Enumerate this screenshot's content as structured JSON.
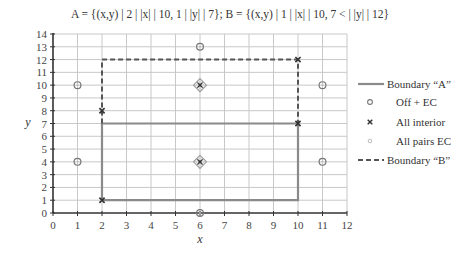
{
  "title": "A = {(x,y) | 2 | |x| | 10, 1 | |y| | 7};  B = {(x,y) | 1 | |x| | 10, 7 < | |y| | 12}",
  "chart_data": {
    "type": "scatter",
    "title": "A = {(x,y) | 2 | |x| | 10, 1 | |y| | 7};  B = {(x,y) | 1 | |x| | 10, 7 < | |y| | 12}",
    "xlabel": "x",
    "ylabel": "y",
    "xlim": [
      0,
      12
    ],
    "ylim": [
      0,
      14
    ],
    "xticks": [
      0,
      1,
      2,
      3,
      4,
      5,
      6,
      7,
      8,
      9,
      10,
      11,
      12
    ],
    "yticks": [
      0,
      1,
      2,
      3,
      4,
      5,
      6,
      7,
      8,
      9,
      10,
      11,
      12,
      13,
      14
    ],
    "grid": true,
    "legend_position": "right",
    "series": [
      {
        "name": "Boundary “A”",
        "kind": "line",
        "style": "solid",
        "color": "#8a8a8a",
        "points": [
          [
            2,
            1
          ],
          [
            10,
            1
          ],
          [
            10,
            7
          ],
          [
            2,
            7
          ],
          [
            2,
            1
          ]
        ]
      },
      {
        "name": "Off + EC",
        "kind": "marker",
        "marker": "circle",
        "color": "#777777",
        "points": [
          [
            1,
            10
          ],
          [
            1,
            4
          ],
          [
            6,
            13
          ],
          [
            6,
            0
          ],
          [
            11,
            10
          ],
          [
            11,
            4
          ]
        ]
      },
      {
        "name": "All interior",
        "kind": "marker",
        "marker": "x",
        "color": "#333333",
        "points": [
          [
            2,
            1
          ],
          [
            2,
            8
          ],
          [
            10,
            12
          ],
          [
            10,
            7
          ],
          [
            6,
            10
          ],
          [
            6,
            4
          ]
        ]
      },
      {
        "name": "All pairs EC",
        "kind": "marker",
        "marker": "diamond",
        "color": "#999999",
        "points": [
          [
            6,
            10
          ],
          [
            6,
            4
          ]
        ]
      },
      {
        "name": "Boundary “B”",
        "kind": "line",
        "style": "dashed",
        "color": "#555555",
        "points": [
          [
            2,
            7
          ],
          [
            2,
            12
          ],
          [
            10,
            12
          ],
          [
            10,
            7
          ]
        ]
      }
    ]
  },
  "legend": [
    {
      "label": "Boundary “A”"
    },
    {
      "label": "Off + EC"
    },
    {
      "label": "All interior"
    },
    {
      "label": "All pairs EC"
    },
    {
      "label": "Boundary “B”"
    }
  ],
  "axes": {
    "xlabel": "x",
    "ylabel": "y"
  }
}
